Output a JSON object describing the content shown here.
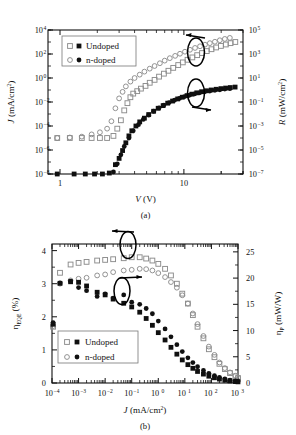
{
  "figure": {
    "background": "#ffffff",
    "ink": "#111111"
  },
  "panels": [
    {
      "id": "a",
      "panel_label": "(a)",
      "legend": {
        "position": "upper-left",
        "entries": [
          {
            "label": "Undoped",
            "markers": [
              "open-square",
              "filled-square"
            ]
          },
          {
            "label": "n-doped",
            "markers": [
              "open-circle",
              "filled-circle"
            ]
          }
        ]
      },
      "annotations": [
        {
          "name": "left-axis-pointer",
          "shape": "ellipse-with-arrow",
          "direction": "left"
        },
        {
          "name": "right-axis-pointer",
          "shape": "ellipse-with-arrow",
          "direction": "right"
        }
      ]
    },
    {
      "id": "b",
      "panel_label": "(b)",
      "legend": {
        "position": "lower-left",
        "entries": [
          {
            "label": "Undoped",
            "markers": [
              "open-square",
              "filled-square"
            ]
          },
          {
            "label": "n-doped",
            "markers": [
              "open-circle",
              "filled-circle"
            ]
          }
        ]
      },
      "annotations": [
        {
          "name": "left-axis-pointer",
          "shape": "ellipse-with-arrow",
          "direction": "left"
        },
        {
          "name": "right-axis-pointer",
          "shape": "ellipse-with-arrow",
          "direction": "right"
        }
      ]
    }
  ],
  "chart_data": [
    {
      "type": "scatter",
      "id": "panel-a",
      "title": "",
      "panel_label": "(a)",
      "xlabel": "V (V)",
      "xlabel_parts": {
        "symbol": "V",
        "unit": "(V)"
      },
      "ylabel": "J (mA/cm2)",
      "ylabel_parts": {
        "symbol": "J",
        "unit": "(mA/cm",
        "exp": "2",
        "close": ")"
      },
      "y2label": "R (mW/cm2)",
      "y2label_parts": {
        "symbol": "R",
        "unit": "(mW/cm",
        "exp": "2",
        "close": ")"
      },
      "xscale": "log",
      "yscale": "log",
      "y2scale": "log",
      "xlim": [
        0.8,
        30
      ],
      "ylim": [
        1e-08,
        10000.0
      ],
      "y2lim": [
        1e-07,
        100000.0
      ],
      "xticks": [
        1,
        10
      ],
      "xticklabels": [
        "1",
        "10"
      ],
      "yticks": [
        1e-08,
        1e-06,
        0.0001,
        0.01,
        1,
        100,
        10000
      ],
      "yticklabels": [
        "10-8",
        "10-6",
        "10-4",
        "10-2",
        "100",
        "102",
        "104"
      ],
      "y2ticks": [
        1e-07,
        1e-05,
        0.001,
        0.1,
        10,
        1000,
        100000
      ],
      "y2ticklabels": [
        "10-7",
        "10-5",
        "10-3",
        "10-1",
        "101",
        "103",
        "105"
      ],
      "grid": false,
      "legend_position": "upper left",
      "series": [
        {
          "name": "Undoped",
          "axis": "left",
          "quantity": "J",
          "marker": "open-square",
          "x": [
            0.95,
            1.2,
            1.5,
            1.8,
            2.1,
            2.4,
            2.7,
            2.9,
            3.1,
            3.3,
            3.5,
            3.7,
            3.9,
            4.2,
            4.5,
            4.9,
            5.3,
            5.8,
            6.3,
            6.9,
            7.5,
            8.2,
            9.0,
            9.8,
            10.7,
            11.7,
            12.8,
            14.0,
            15.3,
            16.7,
            18.2,
            19.9,
            21.8,
            23.8,
            26.0
          ],
          "y": [
            1e-05,
            1e-05,
            1e-05,
            1e-05,
            1e-05,
            1e-05,
            1.5e-05,
            6e-05,
            0.0003,
            0.002,
            0.008,
            0.025,
            0.05,
            0.08,
            0.13,
            0.22,
            0.4,
            0.7,
            1.3,
            2.3,
            4,
            7,
            12,
            20,
            33,
            52,
            80,
            120,
            175,
            250,
            350,
            470,
            620,
            800,
            1000
          ]
        },
        {
          "name": "n-doped",
          "axis": "left",
          "quantity": "J",
          "marker": "open-circle",
          "x": [
            0.95,
            1.2,
            1.5,
            1.8,
            2.1,
            2.4,
            2.6,
            2.8,
            3.0,
            3.2,
            3.4,
            3.7,
            4.0,
            4.4,
            4.8,
            5.3,
            5.8,
            6.4,
            7.0,
            7.7,
            8.5,
            9.3,
            10.2,
            11.2,
            12.3,
            13.5,
            14.8,
            16.2,
            17.8,
            19.5,
            21.4,
            23.5
          ],
          "y": [
            1e-05,
            1.1e-05,
            1.3e-05,
            2e-05,
            3e-05,
            6e-05,
            0.00025,
            0.003,
            0.02,
            0.07,
            0.2,
            0.5,
            1.0,
            1.9,
            3.4,
            6,
            10,
            17,
            28,
            45,
            70,
            105,
            155,
            225,
            320,
            440,
            600,
            800,
            1050,
            1400,
            1800,
            2200
          ]
        },
        {
          "name": "Undoped",
          "axis": "right",
          "quantity": "R",
          "marker": "filled-square",
          "x": [
            0.95,
            1.3,
            1.6,
            1.9,
            2.2,
            2.5,
            2.8,
            3.0,
            3.2,
            3.4,
            3.6,
            3.8,
            4.1,
            4.4,
            4.8,
            5.2,
            5.7,
            6.2,
            6.8,
            7.4,
            8.1,
            8.9,
            9.7,
            10.6,
            11.6,
            12.7,
            13.9,
            15.2,
            16.6,
            18.2,
            19.9,
            21.7,
            23.7,
            25.9
          ],
          "y": [
            1e-07,
            1e-07,
            1e-07,
            1e-07,
            1e-07,
            1.2e-07,
            6e-07,
            2e-06,
            9e-06,
            4e-05,
            0.00015,
            0.0004,
            0.001,
            0.0022,
            0.0045,
            0.009,
            0.017,
            0.03,
            0.05,
            0.08,
            0.12,
            0.18,
            0.25,
            0.34,
            0.45,
            0.58,
            0.72,
            0.86,
            1.0,
            1.15,
            1.3,
            1.45,
            1.6,
            1.75
          ]
        },
        {
          "name": "n-doped",
          "axis": "right",
          "quantity": "R",
          "marker": "filled-circle",
          "x": [
            0.95,
            1.3,
            1.5,
            1.7,
            1.9,
            2.1,
            2.3,
            2.5,
            2.7,
            2.9,
            3.1,
            3.3,
            3.6,
            3.9,
            4.3,
            4.7,
            5.2,
            5.7,
            6.3,
            6.9,
            7.6,
            8.4,
            9.2,
            10.1,
            11.1,
            12.2,
            13.4,
            14.7,
            16.2,
            17.8,
            19.5,
            21.4,
            23.5
          ],
          "y": [
            5e-08,
            5e-08,
            4.5e-08,
            4e-08,
            4e-08,
            3.5e-08,
            5e-08,
            4e-08,
            1.5e-07,
            7e-07,
            4e-06,
            2e-05,
            0.0001,
            0.0004,
            0.0013,
            0.0035,
            0.008,
            0.017,
            0.032,
            0.055,
            0.09,
            0.14,
            0.2,
            0.28,
            0.37,
            0.47,
            0.58,
            0.7,
            0.82,
            0.95,
            1.05,
            1.2,
            1.3
          ]
        }
      ]
    },
    {
      "type": "scatter",
      "id": "panel-b",
      "title": "",
      "panel_label": "(b)",
      "xlabel": "J (mA/cm2)",
      "xlabel_parts": {
        "symbol": "J",
        "unit": "(mA/cm",
        "exp": "2",
        "close": ")"
      },
      "ylabel": "nEQE (%)",
      "ylabel_parts": {
        "symbol": "η",
        "sub": "EQE",
        "unit": "(%)"
      },
      "y2label": "nP (mW/W)",
      "y2label_parts": {
        "symbol": "η",
        "sub": "P",
        "unit": "(mW/W)"
      },
      "xscale": "log",
      "yscale": "linear",
      "y2scale": "linear",
      "xlim": [
        0.0001,
        1000.0
      ],
      "ylim": [
        0,
        4.2
      ],
      "y2lim": [
        0,
        26.5
      ],
      "xticks": [
        0.0001,
        0.001,
        0.01,
        0.1,
        1,
        10,
        100,
        1000
      ],
      "xticklabels": [
        "10-4",
        "10-3",
        "10-2",
        "10-1",
        "100",
        "101",
        "102",
        "103"
      ],
      "yticks": [
        0,
        1,
        2,
        3,
        4
      ],
      "yticklabels": [
        "0",
        "1",
        "2",
        "3",
        "4"
      ],
      "y2ticks": [
        0,
        5,
        10,
        15,
        20,
        25
      ],
      "y2ticklabels": [
        "0",
        "5",
        "10",
        "15",
        "20",
        "25"
      ],
      "grid": false,
      "legend_position": "lower left",
      "series": [
        {
          "name": "Undoped",
          "axis": "left",
          "quantity": "eqe",
          "marker": "open-square",
          "x": [
            0.00011,
            0.0002,
            0.0005,
            0.001,
            0.002,
            0.005,
            0.01,
            0.02,
            0.05,
            0.1,
            0.2,
            0.35,
            0.6,
            1.0,
            1.8,
            3.0,
            5.0,
            8.0,
            13.0,
            20.0,
            30.0,
            50.0,
            80.0,
            130.0,
            200.0,
            320.0,
            500.0,
            800.0,
            1000.0
          ],
          "y": [
            1.7,
            3.33,
            3.58,
            3.63,
            3.66,
            3.7,
            3.72,
            3.74,
            3.77,
            3.8,
            3.8,
            3.76,
            3.7,
            3.6,
            3.45,
            3.25,
            3.0,
            2.7,
            2.4,
            2.05,
            1.7,
            1.35,
            1.02,
            0.78,
            0.58,
            0.42,
            0.3,
            0.2,
            0.15
          ]
        },
        {
          "name": "n-doped",
          "axis": "left",
          "quantity": "eqe",
          "marker": "open-circle",
          "x": [
            0.00011,
            0.0002,
            0.0005,
            0.001,
            0.002,
            0.005,
            0.01,
            0.02,
            0.05,
            0.1,
            0.2,
            0.35,
            0.6,
            1.0,
            1.8,
            3.0,
            5.0,
            8.0,
            13.0,
            20.0,
            30.0,
            50.0,
            80.0,
            130.0,
            200.0,
            320.0,
            500.0,
            800.0,
            1000.0
          ],
          "y": [
            1.72,
            3.0,
            3.1,
            3.15,
            3.18,
            3.25,
            3.28,
            3.35,
            3.4,
            3.42,
            3.45,
            3.44,
            3.4,
            3.32,
            3.2,
            3.05,
            2.88,
            2.65,
            2.4,
            2.1,
            1.78,
            1.42,
            1.1,
            0.85,
            0.62,
            0.45,
            0.32,
            0.22,
            0.16
          ]
        },
        {
          "name": "Undoped",
          "axis": "right",
          "quantity": "pe",
          "marker": "filled-square",
          "x": [
            0.00011,
            0.0002,
            0.0005,
            0.001,
            0.002,
            0.005,
            0.01,
            0.02,
            0.05,
            0.1,
            0.2,
            0.35,
            0.6,
            1.0,
            1.8,
            3.0,
            5.0,
            8.0,
            13.0,
            20.0,
            30.0,
            50.0,
            80.0,
            130.0,
            200.0,
            320.0,
            500.0,
            800.0,
            1000.0
          ],
          "y": [
            11.2,
            19.0,
            19.3,
            19.2,
            18.5,
            17.3,
            16.8,
            16.0,
            15.2,
            14.5,
            13.5,
            12.3,
            11.0,
            9.6,
            8.2,
            6.8,
            5.5,
            4.4,
            3.5,
            2.8,
            2.2,
            1.7,
            1.3,
            1.0,
            0.75,
            0.55,
            0.4,
            0.28,
            0.22
          ]
        },
        {
          "name": "n-doped",
          "axis": "right",
          "quantity": "pe",
          "marker": "filled-circle",
          "x": [
            0.00011,
            0.0002,
            0.0005,
            0.001,
            0.002,
            0.005,
            0.01,
            0.02,
            0.05,
            0.1,
            0.2,
            0.35,
            0.6,
            1.0,
            1.8,
            3.0,
            5.0,
            8.0,
            13.0,
            20.0,
            30.0,
            50.0,
            80.0,
            130.0,
            200.0,
            320.0,
            500.0,
            800.0,
            1000.0
          ],
          "y": [
            11.5,
            19.1,
            19.4,
            18.2,
            17.6,
            16.5,
            17.0,
            16.2,
            16.8,
            15.4,
            15.0,
            14.2,
            13.2,
            11.8,
            10.3,
            8.8,
            7.3,
            6.0,
            4.8,
            3.9,
            3.1,
            2.4,
            1.85,
            1.4,
            1.05,
            0.78,
            0.55,
            0.38,
            0.3
          ]
        }
      ]
    }
  ]
}
